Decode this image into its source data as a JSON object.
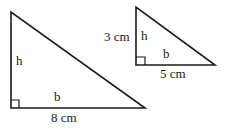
{
  "diagram": {
    "large_triangle": {
      "height_label": "h",
      "base_label": "b",
      "base_value": "8 cm"
    },
    "small_triangle": {
      "height_label": "h",
      "height_value": "3 cm",
      "base_label": "b",
      "base_value": "5 cm"
    },
    "colors": {
      "stroke": "#1a1a1a",
      "background": "#ffffff"
    }
  }
}
